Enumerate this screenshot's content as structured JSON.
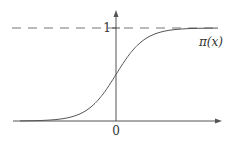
{
  "chart_data": {
    "type": "line",
    "title": "",
    "xlabel": "",
    "ylabel": "",
    "series": [
      {
        "name": "π(x)",
        "function": "logistic sigmoid",
        "x": [
          -6,
          -4,
          -2,
          -1,
          0,
          1,
          2,
          4,
          6
        ],
        "values": [
          0.0025,
          0.018,
          0.119,
          0.269,
          0.5,
          0.731,
          0.881,
          0.982,
          0.9975
        ]
      }
    ],
    "x_ticks": [
      "0"
    ],
    "y_ticks": [
      "1"
    ],
    "asymptote": {
      "y": 1,
      "style": "dashed"
    },
    "ylim": [
      0,
      1
    ],
    "grid": false,
    "legend": "none",
    "annotations": [
      "π(x)"
    ]
  },
  "labels": {
    "curve": "π(x)",
    "y_one": "1",
    "x_zero": "0"
  },
  "colors": {
    "axis": "#555555",
    "curve": "#555555",
    "dashed": "#777777",
    "text": "#333333"
  }
}
